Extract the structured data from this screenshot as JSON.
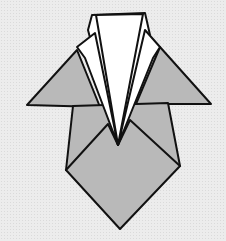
{
  "diagram": {
    "colors": {
      "background": "#ececec",
      "gray_paper": "#b9b9b9",
      "white_paper": "#ffffff",
      "outline": "#111111"
    }
  }
}
